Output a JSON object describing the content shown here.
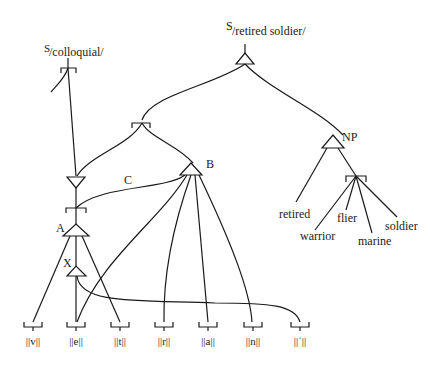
{
  "diagram": {
    "type": "network-linguistic-diagram",
    "top_labels": {
      "retired_soldier": "/retired soldier/",
      "retired_soldier_sup": "S",
      "colloquial": "/colloquial/",
      "colloquial_sup": "S"
    },
    "node_labels": {
      "NP": "NP",
      "B": "B",
      "C": "C",
      "A": "A",
      "X": "X"
    },
    "words": {
      "retired": "retired",
      "warrior": "warrior",
      "flier": "flier",
      "marine": "marine",
      "soldier": "soldier"
    },
    "phonemes": [
      "||v||",
      "||e||",
      "||t||",
      "||r||",
      "||a||",
      "||n||",
      "||ˈ||"
    ]
  }
}
